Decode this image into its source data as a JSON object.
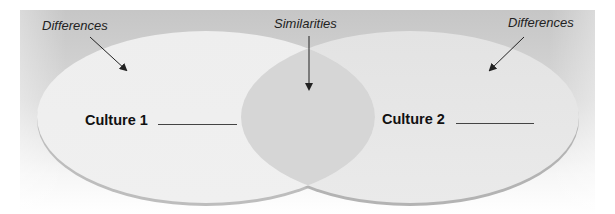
{
  "diagram": {
    "type": "venn",
    "sets": [
      {
        "name": "Culture 1",
        "label": "Culture 1",
        "annotation": "Differences",
        "fill": "#ececec"
      },
      {
        "name": "Culture 2",
        "label": "Culture 2",
        "annotation": "Differences",
        "fill": "#e4e4e4"
      }
    ],
    "intersection": {
      "annotation": "Similarities",
      "fill": "#d6d6d6"
    },
    "background": {
      "top_color": "#c6c6c6",
      "bottom_color": "#ffffff"
    },
    "edge_color": "#b5b5b5",
    "arrow_color": "#222222",
    "blank_line_color": "#444444"
  },
  "annotations": {
    "left": "Differences",
    "center": "Similarities",
    "right": "Differences"
  },
  "culture_labels": {
    "left": "Culture 1",
    "right": "Culture 2"
  }
}
